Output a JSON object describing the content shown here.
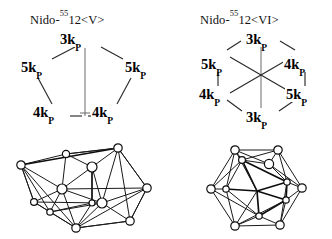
{
  "figure": {
    "background_color": "#ffffff",
    "line_color": "#1a1a1a",
    "panels": [
      {
        "id": "left",
        "title": {
          "prefix": "Nido-",
          "superscript": "55",
          "suffix": "12<V>",
          "full_text": "Nido-55 12<V>"
        },
        "graph": {
          "shape": "pentagon",
          "description": "Five-vertex open (nido) connectivity diagram with a vertical stem from apex to the basal edge",
          "nodes": [
            {
              "name": "apex",
              "label_value": "3k",
              "label_subscript": "P",
              "label_text": "3kP",
              "position": "top"
            },
            {
              "name": "upper-left",
              "label_value": "5k",
              "label_subscript": "P",
              "label_text": "5kP",
              "position": "left"
            },
            {
              "name": "upper-right",
              "label_value": "5k",
              "label_subscript": "P",
              "label_text": "5kP",
              "position": "right"
            },
            {
              "name": "lower-left",
              "label_value": "4k",
              "label_subscript": "P",
              "label_text": "4kP",
              "position": "bottom-left"
            },
            {
              "name": "lower-right",
              "label_value": "4k",
              "label_subscript": "P",
              "label_text": "4kP",
              "position": "bottom-right"
            }
          ],
          "edges": [
            "apex-upper-left",
            "apex-upper-right",
            "upper-left-lower-left",
            "upper-right-lower-right",
            "lower-left-lower-right",
            "apex-base(vertical stem)"
          ]
        },
        "polyhedron": {
          "name": "nido-polyhedron-v",
          "vertex_count": 12,
          "style": "open cage drawn in perspective with circular vertices"
        }
      },
      {
        "id": "right",
        "title": {
          "prefix": "Nido-",
          "superscript": "55",
          "suffix": "12<VI>",
          "full_text": "Nido-55 12<VI>"
        },
        "graph": {
          "shape": "hexagon",
          "description": "Six-vertex closed hexagonal connectivity diagram with three long diagonals meeting at the centre",
          "nodes": [
            {
              "name": "top",
              "label_value": "3k",
              "label_subscript": "P",
              "label_text": "3kP",
              "position": "top"
            },
            {
              "name": "upper-left",
              "label_value": "5k",
              "label_subscript": "P",
              "label_text": "5kP",
              "position": "upper-left"
            },
            {
              "name": "upper-right",
              "label_value": "4k",
              "label_subscript": "P",
              "label_text": "4kP",
              "position": "upper-right"
            },
            {
              "name": "lower-left",
              "label_value": "4k",
              "label_subscript": "P",
              "label_text": "4kP",
              "position": "lower-left"
            },
            {
              "name": "lower-right",
              "label_value": "5k",
              "label_subscript": "P",
              "label_text": "5kP",
              "position": "lower-right"
            },
            {
              "name": "bottom",
              "label_value": "3k",
              "label_subscript": "P",
              "label_text": "3kP",
              "position": "bottom"
            }
          ],
          "edges": [
            "top-upper-left",
            "top-upper-right",
            "upper-left-lower-left",
            "upper-right-lower-right",
            "lower-left-bottom",
            "lower-right-bottom",
            "top-bottom (diagonal)",
            "upper-left-lower-right (diagonal)",
            "upper-right-lower-left (diagonal)"
          ]
        },
        "polyhedron": {
          "name": "nido-polyhedron-vi",
          "vertex_count": 12,
          "style": "icosahedral-looking closed cage drawn in perspective with circular vertices"
        }
      }
    ]
  }
}
